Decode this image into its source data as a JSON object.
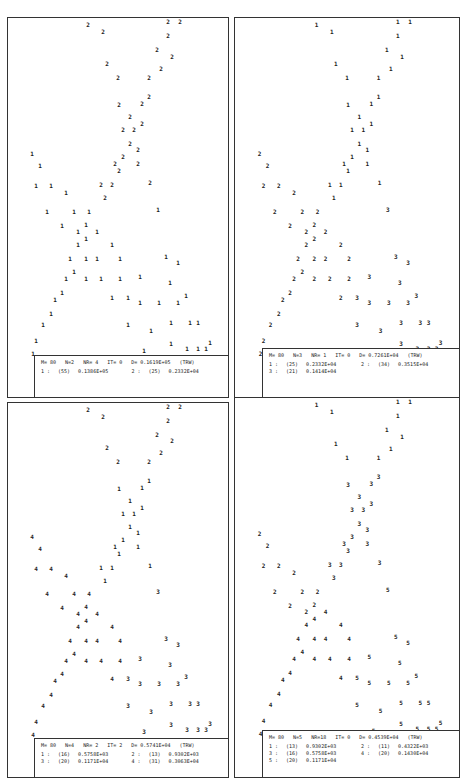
{
  "chart_data": {
    "type": "scatter",
    "point_glyphs": "cluster numbers",
    "panels": [
      {
        "id": "top-left",
        "frame": {
          "x": 7,
          "y": 17,
          "w": 222,
          "h": 381
        },
        "legend_box": {
          "x": 34,
          "y": 355,
          "w": 195,
          "h": 43
        },
        "header": {
          "M": "80",
          "N": "2",
          "NR": "4",
          "IT": "0",
          "D": "0.1619E+05",
          "tag": "(TRW)"
        },
        "header_text": "M= 80   N=2   NR= 4   IT= 0   D= 0.1619E+05   (TRW)",
        "clusters": [
          {
            "id": "1",
            "count": "(55)",
            "value": "0.1386E+05"
          },
          {
            "id": "2",
            "count": "(25)",
            "value": "0.2332E+04"
          }
        ],
        "labels": {
          "A1": "2",
          "A2": "2",
          "L1": "1",
          "L2": "1",
          "R": "1"
        }
      },
      {
        "id": "top-right",
        "frame": {
          "x": 234,
          "y": 17,
          "w": 226,
          "h": 381
        },
        "legend_box": {
          "x": 262,
          "y": 348,
          "w": 198,
          "h": 50
        },
        "header": {
          "M": "80",
          "N": "3",
          "NR": "1",
          "IT": "0",
          "D": "0.7261E+04",
          "tag": "(TRW)"
        },
        "header_text": "M= 80   N=3   NR= 1   IT= 0   D= 0.7261E+04   (TRW)",
        "clusters": [
          {
            "id": "1",
            "count": "(25)",
            "value": "0.2332E+04"
          },
          {
            "id": "2",
            "count": "(34)",
            "value": "0.3515E+04"
          },
          {
            "id": "3",
            "count": "(21)",
            "value": "0.1414E+04"
          }
        ],
        "labels": {
          "A1": "1",
          "A2": "1",
          "L1": "2",
          "L2": "2",
          "R": "3"
        }
      },
      {
        "id": "bottom-left",
        "frame": {
          "x": 7,
          "y": 402,
          "w": 222,
          "h": 376
        },
        "legend_box": {
          "x": 34,
          "y": 738,
          "w": 195,
          "h": 40
        },
        "header": {
          "M": "80",
          "N": "4",
          "NR": "2",
          "IT": "2",
          "D": "0.5741E+04",
          "tag": "(TRW)"
        },
        "header_text": "M= 80   N=4   NR= 2   IT= 2   D= 0.5741E+04   (TRW)",
        "clusters": [
          {
            "id": "1",
            "count": "(16)",
            "value": "0.5758E+03"
          },
          {
            "id": "2",
            "count": "(13)",
            "value": "0.9302E+03"
          },
          {
            "id": "3",
            "count": "(20)",
            "value": "0.1171E+04"
          },
          {
            "id": "4",
            "count": "(31)",
            "value": "0.3063E+04"
          }
        ],
        "labels": {
          "A1": "2",
          "A2": "1",
          "L1": "4",
          "L2": "4",
          "R": "3"
        }
      },
      {
        "id": "bottom-right",
        "frame": {
          "x": 234,
          "y": 397,
          "w": 226,
          "h": 381
        },
        "legend_box": {
          "x": 262,
          "y": 730,
          "w": 198,
          "h": 48
        },
        "header": {
          "M": "80",
          "N": "5",
          "NR": "18",
          "IT": "0",
          "D": "0.4539E+04",
          "tag": "(TRW)"
        },
        "header_text": "M= 80   N=5   NR=18   IT= 0   D= 0.4539E+04   (TRW)",
        "clusters": [
          {
            "id": "1",
            "count": "(13)",
            "value": "0.9302E+03"
          },
          {
            "id": "2",
            "count": "(11)",
            "value": "0.4322E+03"
          },
          {
            "id": "3",
            "count": "(16)",
            "value": "0.5758E+03"
          },
          {
            "id": "4",
            "count": "(20)",
            "value": "0.1430E+04"
          },
          {
            "id": "5",
            "count": "(20)",
            "value": "0.1171E+04"
          }
        ],
        "labels": {
          "A1": "1",
          "A2": "3",
          "L1": "2",
          "L2": "4",
          "R": "5"
        }
      }
    ],
    "points": [
      [
        81,
        8,
        "A1"
      ],
      [
        96,
        15,
        "A1"
      ],
      [
        161,
        5,
        "A1"
      ],
      [
        173,
        5,
        "A1"
      ],
      [
        161,
        19,
        "A1"
      ],
      [
        150,
        33,
        "A1"
      ],
      [
        165,
        40,
        "A1"
      ],
      [
        100,
        47,
        "A1"
      ],
      [
        154,
        52,
        "A1"
      ],
      [
        111,
        61,
        "A1"
      ],
      [
        142,
        61,
        "A1"
      ],
      [
        142,
        80,
        "A2"
      ],
      [
        135,
        87,
        "A2"
      ],
      [
        112,
        88,
        "A2"
      ],
      [
        123,
        100,
        "A2"
      ],
      [
        135,
        107,
        "A2"
      ],
      [
        116,
        113,
        "A2"
      ],
      [
        127,
        113,
        "A2"
      ],
      [
        123,
        127,
        "A2"
      ],
      [
        131,
        133,
        "A2"
      ],
      [
        116,
        140,
        "A2"
      ],
      [
        108,
        147,
        "A2"
      ],
      [
        112,
        154,
        "A2"
      ],
      [
        131,
        147,
        "A2"
      ],
      [
        143,
        166,
        "A2"
      ],
      [
        25,
        137,
        "L1"
      ],
      [
        33,
        149,
        "L1"
      ],
      [
        29,
        169,
        "L1"
      ],
      [
        44,
        169,
        "L1"
      ],
      [
        59,
        176,
        "L1"
      ],
      [
        94,
        168,
        "A2"
      ],
      [
        105,
        168,
        "A2"
      ],
      [
        98,
        181,
        "A2"
      ],
      [
        40,
        195,
        "L1"
      ],
      [
        67,
        195,
        "L1"
      ],
      [
        82,
        195,
        "L1"
      ],
      [
        151,
        193,
        "R"
      ],
      [
        55,
        209,
        "L1"
      ],
      [
        79,
        208,
        "L1"
      ],
      [
        71,
        215,
        "L1"
      ],
      [
        90,
        215,
        "L2"
      ],
      [
        79,
        222,
        "L2"
      ],
      [
        71,
        228,
        "L2"
      ],
      [
        105,
        228,
        "L2"
      ],
      [
        63,
        242,
        "L2"
      ],
      [
        79,
        242,
        "L2"
      ],
      [
        90,
        242,
        "L2"
      ],
      [
        113,
        242,
        "L2"
      ],
      [
        159,
        240,
        "R"
      ],
      [
        171,
        246,
        "R"
      ],
      [
        67,
        255,
        "L2"
      ],
      [
        59,
        262,
        "L2"
      ],
      [
        79,
        262,
        "L2"
      ],
      [
        94,
        262,
        "L2"
      ],
      [
        113,
        262,
        "L2"
      ],
      [
        133,
        260,
        "R"
      ],
      [
        163,
        266,
        "R"
      ],
      [
        55,
        276,
        "L2"
      ],
      [
        48,
        283,
        "L2"
      ],
      [
        105,
        281,
        "L2"
      ],
      [
        121,
        281,
        "R"
      ],
      [
        133,
        286,
        "R"
      ],
      [
        152,
        286,
        "R"
      ],
      [
        171,
        286,
        "R"
      ],
      [
        179,
        279,
        "R"
      ],
      [
        44,
        297,
        "L2"
      ],
      [
        36,
        308,
        "L2"
      ],
      [
        121,
        308,
        "R"
      ],
      [
        144,
        314,
        "R"
      ],
      [
        164,
        306,
        "R"
      ],
      [
        183,
        306,
        "R"
      ],
      [
        191,
        306,
        "R"
      ],
      [
        29,
        324,
        "L2"
      ],
      [
        164,
        327,
        "R"
      ],
      [
        26,
        337,
        "L2"
      ],
      [
        137,
        334,
        "R"
      ],
      [
        180,
        332,
        "R"
      ],
      [
        191,
        332,
        "R"
      ],
      [
        199,
        332,
        "R"
      ],
      [
        203,
        326,
        "R"
      ]
    ]
  }
}
